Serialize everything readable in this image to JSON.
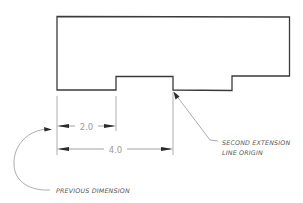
{
  "diagram": {
    "type": "technical-dimension-drawing",
    "colors": {
      "outline": "#3a3a3a",
      "dimension_lines": "#8a8a8a",
      "dimension_text": "#9a9a9a",
      "note_text": "#555555",
      "arrowheads": "#2a2a2a"
    },
    "dimensions": [
      {
        "id": "dim-1",
        "value": "2.0"
      },
      {
        "id": "dim-2",
        "value": "4.0"
      }
    ],
    "annotations": {
      "second_extension": {
        "line1": "SECOND EXTENSION",
        "line2": "LINE ORIGIN"
      },
      "previous_dimension": {
        "text": "PREVIOUS DIMENSION"
      }
    }
  }
}
